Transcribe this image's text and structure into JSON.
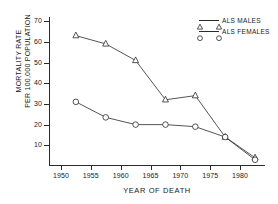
{
  "chart_data": {
    "type": "line",
    "title": "",
    "xlabel": "YEAR OF DEATH",
    "ylabel": "MORTALITY RATE PER 100,000 POPULATION",
    "ylabel_lines": [
      "MORTALITY RATE",
      "PER 100,000 POPULATION"
    ],
    "xlim": [
      1948,
      1984
    ],
    "ylim": [
      0,
      72
    ],
    "grid": false,
    "legend_position": "top-right",
    "x_ticks": [
      1950,
      1955,
      1960,
      1965,
      1970,
      1975,
      1980
    ],
    "x_tick_labels": [
      "1950",
      "1955",
      "1960",
      "1965",
      "1970",
      "1975",
      "1980"
    ],
    "y_ticks": [
      10,
      20,
      30,
      40,
      50,
      60,
      70
    ],
    "y_tick_labels": [
      "10",
      "20",
      "30",
      "40",
      "50",
      "60",
      "70"
    ],
    "x": [
      1952.5,
      1957.5,
      1962.5,
      1967.5,
      1972.5,
      1977.5,
      1982.5
    ],
    "series": [
      {
        "name": "ALS MALES",
        "marker": "triangle",
        "color": "#2a2a2a",
        "values": [
          63,
          59,
          51,
          32,
          34,
          14,
          4
        ]
      },
      {
        "name": "ALS FEMALES",
        "marker": "circle",
        "color": "#2a2a2a",
        "values": [
          31,
          23.5,
          20,
          20,
          19,
          14,
          3
        ]
      }
    ]
  },
  "legend": {
    "items": [
      {
        "label": "ALS MALES",
        "marker": "triangle"
      },
      {
        "label": "ALS FEMALES",
        "marker": "circle"
      }
    ]
  }
}
